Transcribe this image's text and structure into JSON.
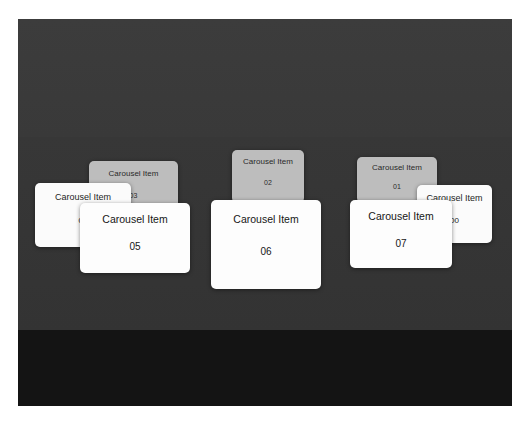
{
  "app": {
    "view_name": "carousel",
    "background_color": "#3a3a3a",
    "backdrop_lower_color": "#141414",
    "page_background": "#ffffff"
  },
  "carousel": {
    "cards": [
      {
        "id": "card-03",
        "title": "Carousel Item",
        "index": "03",
        "tier": "back",
        "bg_color": "#bdbdbd",
        "x": 71,
        "y": 142,
        "width": 89,
        "height": 57,
        "z": 1
      },
      {
        "id": "card-04",
        "title": "Carousel Item",
        "index": "04",
        "tier": "mid",
        "bg_color": "#fbfbfb",
        "x": 17,
        "y": 164,
        "width": 96,
        "height": 64,
        "z": 2
      },
      {
        "id": "card-05",
        "title": "Carousel Item",
        "index": "05",
        "tier": "front",
        "bg_color": "#fdfdfd",
        "x": 62,
        "y": 184,
        "width": 110,
        "height": 70,
        "z": 3
      },
      {
        "id": "card-02",
        "title": "Carousel Item",
        "index": "02",
        "tier": "back",
        "bg_color": "#bdbdbd",
        "x": 214,
        "y": 131,
        "width": 72,
        "height": 53,
        "z": 1
      },
      {
        "id": "card-06",
        "title": "Carousel Item",
        "index": "06",
        "tier": "front",
        "bg_color": "#fdfdfd",
        "x": 193,
        "y": 181,
        "width": 110,
        "height": 89,
        "z": 3
      },
      {
        "id": "card-01",
        "title": "Carousel Item",
        "index": "01",
        "tier": "back",
        "bg_color": "#bdbdbd",
        "x": 339,
        "y": 138,
        "width": 80,
        "height": 46,
        "z": 1
      },
      {
        "id": "card-00",
        "title": "Carousel Item",
        "index": "00",
        "tier": "mid",
        "bg_color": "#fbfbfb",
        "x": 399,
        "y": 166,
        "width": 75,
        "height": 58,
        "z": 2
      },
      {
        "id": "card-07",
        "title": "Carousel Item",
        "index": "07",
        "tier": "front",
        "bg_color": "#fdfdfd",
        "x": 332,
        "y": 181,
        "width": 102,
        "height": 68,
        "z": 3
      }
    ]
  }
}
